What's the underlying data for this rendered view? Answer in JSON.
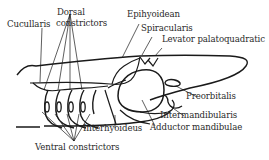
{
  "diagram": {
    "labels": {
      "cucullaris": "Cucullaris",
      "dorsal_line1": "Dorsal",
      "dorsal_line2": "constrictors",
      "epihyoidean": "Epihyoidean",
      "spiracularis": "Spiracularis",
      "levator": "Levator palatoquadratic",
      "preorbitalis": "Preorbitalis",
      "intermandibularis": "Intermandibularis",
      "interhyoideus": "Interhyoideus",
      "adductor": "Adductor mandibulae",
      "ventral": "Ventral constrictors"
    },
    "colors": {
      "line": "#1a1a1a",
      "text": "#2a2a2a",
      "background": "#ffffff"
    }
  }
}
